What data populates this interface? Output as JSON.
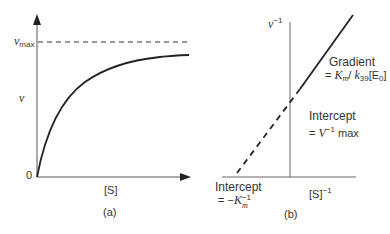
{
  "panel_a": {
    "caption": "(a)",
    "y_axis_label": "v",
    "x_axis_label": "[S]",
    "origin_label": "0",
    "asymptote_label": {
      "main": "v",
      "sub": "max"
    },
    "curve": "Michaelis–Menten hyperbola approaching vmax"
  },
  "panel_b": {
    "caption": "(b)",
    "y_axis_label": {
      "main": "v",
      "sup": "−1"
    },
    "x_axis_label": {
      "main": "[S]",
      "sup": "−1"
    },
    "gradient_label": {
      "title": "Gradient",
      "eq_prefix": "= ",
      "km": "K",
      "km_sub": "m",
      "slash": "/ ",
      "k": "k",
      "k_sub": "39",
      "e": "[E",
      "e_sub": "0",
      "e_close": "]"
    },
    "y_intercept_label": {
      "title": "Intercept",
      "eq_prefix": "= ",
      "v": "V",
      "v_sup": "−1",
      "suffix": " max"
    },
    "x_intercept_label": {
      "title": "Intercept",
      "eq_prefix": "= −",
      "km": "K",
      "km_sub": "m",
      "km_sup": "−1"
    }
  }
}
